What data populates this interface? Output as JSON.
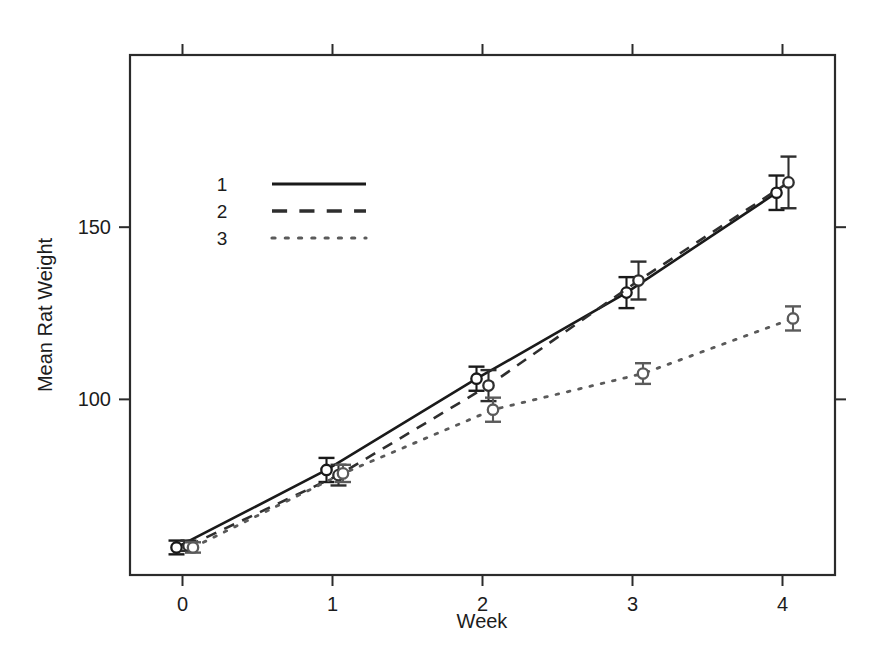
{
  "chart_data": {
    "type": "line",
    "title": "",
    "xlabel": "Week",
    "ylabel": "Mean Rat Weight",
    "x": [
      0,
      1,
      2,
      3,
      4
    ],
    "xtick_labels": [
      "0",
      "1",
      "2",
      "3",
      "4"
    ],
    "ytick_values": [
      100,
      150
    ],
    "ytick_labels": [
      "100",
      "150"
    ],
    "xlim": [
      -0.35,
      4.35
    ],
    "ylim": [
      49,
      200
    ],
    "grid": false,
    "legend_position": "upper-left-inside",
    "error_bars": "vertical, capped",
    "marker": "open circle",
    "series": [
      {
        "name": "1",
        "label": "1",
        "linestyle": "solid",
        "color": "#1a1a1a",
        "x_offset": -0.04,
        "values": [
          57.0,
          79.5,
          106.0,
          131.0,
          160.0
        ],
        "errors": [
          2.0,
          3.5,
          3.5,
          4.5,
          5.0
        ]
      },
      {
        "name": "2",
        "label": "2",
        "linestyle": "dashed",
        "color": "#2e2e2e",
        "x_offset": 0.04,
        "values": [
          57.5,
          78.0,
          104.0,
          134.5,
          163.0
        ],
        "errors": [
          1.5,
          3.0,
          4.5,
          5.5,
          7.5
        ]
      },
      {
        "name": "3",
        "label": "3",
        "linestyle": "dotted",
        "color": "#5a5a5a",
        "x_offset": 0.07,
        "values": [
          57.0,
          78.5,
          97.0,
          107.5,
          123.5
        ],
        "errors": [
          1.5,
          2.5,
          3.5,
          3.0,
          3.5
        ]
      }
    ]
  },
  "legend": {
    "entries": [
      {
        "label": "1",
        "linestyle": "solid"
      },
      {
        "label": "2",
        "linestyle": "dashed"
      },
      {
        "label": "3",
        "linestyle": "dotted"
      }
    ]
  },
  "axes": {
    "x_title": "Week",
    "y_title": "Mean Rat Weight"
  }
}
